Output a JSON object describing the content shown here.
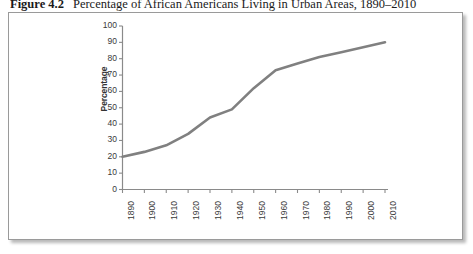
{
  "figure": {
    "number": "Figure 4.2",
    "caption": "Percentage of African Americans Living in Urban Areas, 1890–2010"
  },
  "axis": {
    "y_title": "Percentage",
    "y_ticks": [
      "100",
      "90",
      "80",
      "70",
      "60",
      "50",
      "40",
      "30",
      "20",
      "10",
      "0"
    ],
    "x_ticks": [
      "1890",
      "1900",
      "1910",
      "1920",
      "1930",
      "1940",
      "1950",
      "1960",
      "1970",
      "1980",
      "1990",
      "2000",
      "2010"
    ]
  },
  "colors": {
    "line": "#808080",
    "axis": "#808080",
    "text": "#3a3a3a",
    "frame_border": "#9a9a9a",
    "background": "#ffffff"
  },
  "chart_data": {
    "type": "line",
    "title": "Percentage of African Americans Living in Urban Areas, 1890–2010",
    "xlabel": "",
    "ylabel": "Percentage",
    "xlim": [
      1890,
      2010
    ],
    "ylim": [
      0,
      100
    ],
    "ytick_step": 10,
    "xtick_step": 10,
    "grid": false,
    "legend": "none",
    "categories": [
      1890,
      1900,
      1910,
      1920,
      1930,
      1940,
      1950,
      1960,
      1970,
      1980,
      1990,
      2000,
      2010
    ],
    "values": [
      20,
      23,
      27,
      34,
      44,
      49,
      62,
      73,
      77,
      81,
      84,
      87,
      90
    ],
    "series": [
      {
        "name": "Percentage urban",
        "values": [
          20,
          23,
          27,
          34,
          44,
          49,
          62,
          73,
          77,
          81,
          84,
          87,
          90
        ]
      }
    ]
  }
}
